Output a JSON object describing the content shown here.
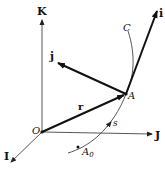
{
  "figure": {
    "type": "vector-diagram",
    "labels": {
      "K": "K",
      "J": "J",
      "I": "I",
      "O": "O",
      "r": "r",
      "A": "A",
      "j": "j",
      "i": "i",
      "C": "C",
      "s": "s",
      "A0_main": "A",
      "A0_sub": "0"
    },
    "colors": {
      "ink": "#111111",
      "thin": "#444444",
      "background": "#ffffff"
    }
  }
}
